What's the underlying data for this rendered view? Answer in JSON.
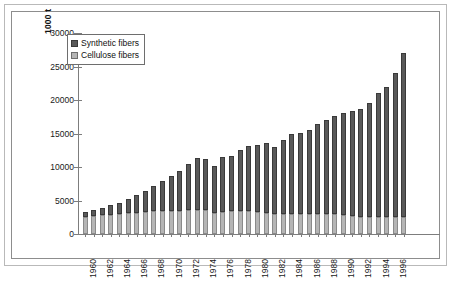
{
  "chart_data": {
    "type": "bar",
    "stacked": true,
    "title": "",
    "xlabel": "",
    "ylabel": "1000 t",
    "ylim": [
      0,
      30000
    ],
    "ytick_step": 5000,
    "ytick_labels": [
      "30000",
      "25000",
      "20000",
      "15000",
      "10000",
      "5000",
      "0"
    ],
    "grid": false,
    "legend_position": "top-left-inside",
    "categories": [
      "1960",
      "1961",
      "1962",
      "1963",
      "1964",
      "1965",
      "1966",
      "1967",
      "1968",
      "1969",
      "1970",
      "1971",
      "1972",
      "1973",
      "1974",
      "1975",
      "1976",
      "1977",
      "1978",
      "1979",
      "1980",
      "1981",
      "1982",
      "1983",
      "1984",
      "1985",
      "1986",
      "1987",
      "1988",
      "1989",
      "1990",
      "1991",
      "1992",
      "1993",
      "1994",
      "1995",
      "1996",
      "1997"
    ],
    "tick_labels_shown": [
      "1960",
      "1962",
      "1964",
      "1966",
      "1968",
      "1970",
      "1972",
      "1974",
      "1976",
      "1978",
      "1980",
      "1982",
      "1984",
      "1986",
      "1988",
      "1990",
      "1992",
      "1994",
      "1996"
    ],
    "series": [
      {
        "name": "Cellulose fibers",
        "color": "#b5b5b5",
        "values": [
          2600,
          2700,
          2800,
          2900,
          3000,
          3100,
          3200,
          3300,
          3400,
          3450,
          3500,
          3500,
          3550,
          3600,
          3550,
          3200,
          3350,
          3400,
          3400,
          3400,
          3300,
          3200,
          2950,
          3000,
          3050,
          3000,
          2950,
          2950,
          2950,
          2950,
          2900,
          2700,
          2600,
          2500,
          2600,
          2600,
          2500,
          2500
        ]
      },
      {
        "name": "Synthetic fibers",
        "color": "#595959",
        "values": [
          700,
          900,
          1100,
          1400,
          1700,
          2100,
          2600,
          3100,
          3800,
          4500,
          5200,
          5900,
          6900,
          7800,
          7600,
          6900,
          8100,
          8300,
          9100,
          9800,
          10000,
          10400,
          10000,
          11000,
          11900,
          12100,
          12600,
          13400,
          14100,
          14700,
          15200,
          15600,
          16000,
          17100,
          18400,
          19400,
          21500,
          24500
        ]
      }
    ],
    "totals": [
      3300,
      3600,
      3900,
      4300,
      4700,
      5200,
      5800,
      6400,
      7200,
      7950,
      8700,
      9400,
      10450,
      11400,
      11150,
      10100,
      11450,
      11700,
      12500,
      13200,
      13300,
      13600,
      12950,
      14000,
      14950,
      15100,
      15550,
      16350,
      17050,
      17650,
      18100,
      18300,
      18600,
      19600,
      21000,
      22000,
      24000,
      27000
    ]
  },
  "legend": {
    "items": [
      {
        "label": "Synthetic fibers",
        "swatch": "synthetic-swatch"
      },
      {
        "label": "Cellulose fibers",
        "swatch": "cellulose-swatch"
      }
    ]
  }
}
